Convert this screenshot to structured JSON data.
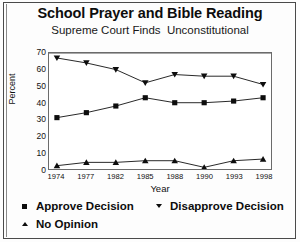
{
  "page": {
    "title": "School Prayer and Bible Reading",
    "subtitle": "Supreme Court Finds  Unconstitutional"
  },
  "chart_data": {
    "type": "line",
    "title": "School Prayer and Bible Reading",
    "subtitle": "Supreme Court Finds  Unconstitutional",
    "xlabel": "Year",
    "ylabel": "Percent",
    "categories": [
      "1974",
      "1977",
      "1982",
      "1985",
      "1988",
      "1990",
      "1993",
      "1998"
    ],
    "x": [
      1974,
      1977,
      1982,
      1985,
      1988,
      1990,
      1993,
      1998
    ],
    "ylim": [
      0,
      70
    ],
    "yticks": [
      0,
      10,
      20,
      30,
      40,
      50,
      60,
      70
    ],
    "grid": false,
    "legend_position": "below",
    "series": [
      {
        "name": "Approve Decision",
        "marker": "square",
        "color": "#0d0d0d",
        "values": [
          31,
          34,
          38,
          43,
          40,
          40,
          41,
          43
        ]
      },
      {
        "name": "Disapprove Decision",
        "marker": "triangle-down",
        "color": "#0d0d0d",
        "values": [
          67,
          64,
          60,
          52,
          57,
          56,
          56,
          51
        ]
      },
      {
        "name": "No Opinion",
        "marker": "triangle-up",
        "color": "#0d0d0d",
        "values": [
          2,
          4,
          4,
          5,
          5,
          1,
          5,
          6
        ]
      }
    ]
  },
  "legend": {
    "approve": "Approve Decision",
    "disapprove": "Disapprove Decision",
    "no_opinion": "No Opinion"
  }
}
